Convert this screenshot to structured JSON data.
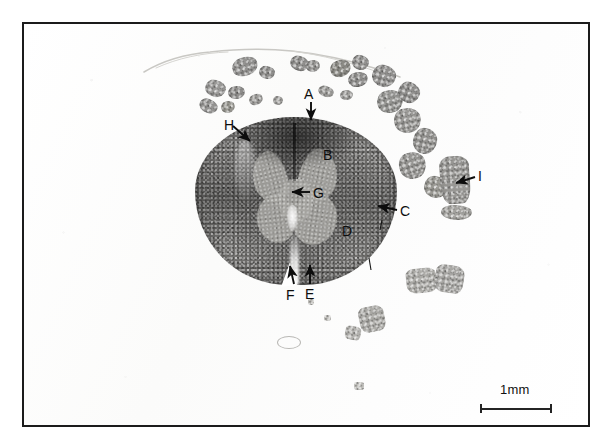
{
  "figure": {
    "caption_visible": false,
    "background_color": "#ffffff",
    "frame_color": "#1b1b1b",
    "specimen": "spinal cord transverse section micrograph"
  },
  "scale_bar": {
    "label": "1mm",
    "length_px": 72,
    "color": "#242424"
  },
  "markers": [
    {
      "id": "A",
      "label": "A",
      "label_x": 304,
      "label_y": 87,
      "arrow": {
        "x1": 311,
        "y1": 102,
        "x2": 311,
        "y2": 120,
        "dir": "down"
      }
    },
    {
      "id": "B",
      "label": "B",
      "label_x": 323,
      "label_y": 148,
      "arrow": null
    },
    {
      "id": "C",
      "label": "C",
      "label_x": 400,
      "label_y": 204,
      "arrow": {
        "x1": 397,
        "y1": 210,
        "x2": 378,
        "y2": 206,
        "dir": "left"
      }
    },
    {
      "id": "D",
      "label": "D",
      "label_x": 342,
      "label_y": 224,
      "arrow": null
    },
    {
      "id": "E",
      "label": "E",
      "label_x": 305,
      "label_y": 287,
      "arrow": {
        "x1": 310,
        "y1": 284,
        "x2": 310,
        "y2": 265,
        "dir": "up"
      }
    },
    {
      "id": "F",
      "label": "F",
      "label_x": 286,
      "label_y": 288,
      "arrow": {
        "x1": 294,
        "y1": 284,
        "x2": 290,
        "y2": 266,
        "dir": "up"
      }
    },
    {
      "id": "G",
      "label": "G",
      "label_x": 313,
      "label_y": 186,
      "arrow": {
        "x1": 310,
        "y1": 192,
        "x2": 292,
        "y2": 192,
        "dir": "left"
      }
    },
    {
      "id": "H",
      "label": "H",
      "label_x": 224,
      "label_y": 118,
      "arrow": {
        "x1": 233,
        "y1": 126,
        "x2": 250,
        "y2": 141,
        "dir": "down-right"
      }
    },
    {
      "id": "I",
      "label": "I",
      "label_x": 478,
      "label_y": 169,
      "arrow": {
        "x1": 475,
        "y1": 177,
        "x2": 456,
        "y2": 183,
        "dir": "left"
      }
    }
  ],
  "nerve_roots": [
    {
      "x": 232,
      "y": 57,
      "w": 26,
      "h": 19,
      "rot": -18,
      "tone": "#8e8d8b"
    },
    {
      "x": 205,
      "y": 80,
      "w": 21,
      "h": 17,
      "rot": 12,
      "tone": "#969593"
    },
    {
      "x": 228,
      "y": 86,
      "w": 17,
      "h": 13,
      "rot": -8,
      "tone": "#8a8987"
    },
    {
      "x": 199,
      "y": 99,
      "w": 19,
      "h": 14,
      "rot": 22,
      "tone": "#92918f"
    },
    {
      "x": 221,
      "y": 101,
      "w": 14,
      "h": 12,
      "rot": -14,
      "tone": "#97968f"
    },
    {
      "x": 259,
      "y": 66,
      "w": 16,
      "h": 13,
      "rot": 9,
      "tone": "#8d8c8a"
    },
    {
      "x": 249,
      "y": 94,
      "w": 14,
      "h": 11,
      "rot": -22,
      "tone": "#9b9a97"
    },
    {
      "x": 273,
      "y": 96,
      "w": 10,
      "h": 9,
      "rot": 5,
      "tone": "#a3a29f"
    },
    {
      "x": 290,
      "y": 56,
      "w": 19,
      "h": 15,
      "rot": 16,
      "tone": "#8b8a88"
    },
    {
      "x": 306,
      "y": 60,
      "w": 14,
      "h": 12,
      "rot": -10,
      "tone": "#949391"
    },
    {
      "x": 318,
      "y": 86,
      "w": 16,
      "h": 11,
      "rot": 18,
      "tone": "#9a9996"
    },
    {
      "x": 340,
      "y": 90,
      "w": 13,
      "h": 10,
      "rot": -6,
      "tone": "#a09f9c"
    },
    {
      "x": 330,
      "y": 60,
      "w": 21,
      "h": 17,
      "rot": -20,
      "tone": "#86857f"
    },
    {
      "x": 352,
      "y": 55,
      "w": 17,
      "h": 15,
      "rot": 11,
      "tone": "#8f8e8c"
    },
    {
      "x": 348,
      "y": 72,
      "w": 20,
      "h": 15,
      "rot": -12,
      "tone": "#8a8987"
    },
    {
      "x": 372,
      "y": 65,
      "w": 24,
      "h": 22,
      "rot": 14,
      "tone": "#8d8c8a"
    },
    {
      "x": 377,
      "y": 90,
      "w": 26,
      "h": 23,
      "rot": -16,
      "tone": "#90908d"
    },
    {
      "x": 398,
      "y": 82,
      "w": 22,
      "h": 21,
      "rot": 20,
      "tone": "#8b8a88"
    },
    {
      "x": 394,
      "y": 108,
      "w": 27,
      "h": 25,
      "rot": -10,
      "tone": "#949390"
    },
    {
      "x": 413,
      "y": 128,
      "w": 24,
      "h": 26,
      "rot": 12,
      "tone": "#8f8e8b"
    },
    {
      "x": 399,
      "y": 152,
      "w": 27,
      "h": 27,
      "rot": -18,
      "tone": "#92918e"
    },
    {
      "x": 424,
      "y": 176,
      "w": 24,
      "h": 22,
      "rot": 8,
      "tone": "#96958f"
    },
    {
      "x": 440,
      "y": 156,
      "w": 30,
      "h": 48,
      "rot": -4,
      "tone": "#93928f",
      "big": true
    },
    {
      "x": 441,
      "y": 205,
      "w": 31,
      "h": 15,
      "rot": 2,
      "tone": "#a09f9b"
    }
  ],
  "fragments": [
    {
      "x": 406,
      "y": 268,
      "w": 31,
      "h": 25,
      "rot": -6,
      "tone": "#a9a8a4"
    },
    {
      "x": 435,
      "y": 265,
      "w": 29,
      "h": 28,
      "rot": 8,
      "tone": "#a4a3a0"
    },
    {
      "x": 359,
      "y": 306,
      "w": 26,
      "h": 26,
      "rot": -12,
      "tone": "#a7a6a2"
    },
    {
      "x": 345,
      "y": 326,
      "w": 16,
      "h": 14,
      "rot": 10,
      "tone": "#b0afab"
    },
    {
      "x": 324,
      "y": 315,
      "w": 7,
      "h": 6,
      "rot": 0,
      "tone": "#bcbbb7"
    },
    {
      "x": 308,
      "y": 298,
      "w": 6,
      "h": 7,
      "rot": 0,
      "tone": "#b7b6b2"
    },
    {
      "x": 354,
      "y": 382,
      "w": 10,
      "h": 8,
      "rot": 0,
      "tone": "#bdbcb8"
    }
  ]
}
